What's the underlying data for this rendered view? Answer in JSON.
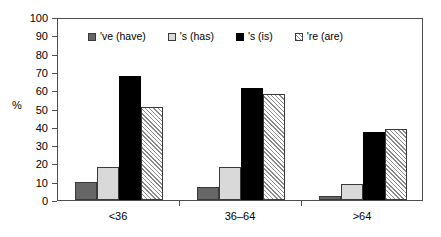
{
  "chart_data": {
    "type": "bar",
    "title": "",
    "xlabel": "",
    "ylabel": "%",
    "ylim": [
      0,
      100
    ],
    "ytick_step": 10,
    "yticks": [
      "100",
      "90",
      "80",
      "70",
      "60",
      "50",
      "40",
      "30",
      "20",
      "10",
      "0"
    ],
    "grid": false,
    "legend_position": "inside-top",
    "categories": [
      "<36",
      "36–64",
      ">64"
    ],
    "series": [
      {
        "name": "'ve (have)",
        "color": "#666666",
        "fill": "solid-dark-gray",
        "values": [
          10,
          7,
          2
        ]
      },
      {
        "name": "'s (has)",
        "color": "#d9d9d9",
        "fill": "solid-light-gray",
        "values": [
          18,
          18,
          9
        ]
      },
      {
        "name": "'s (is)",
        "color": "#000000",
        "fill": "solid-black",
        "values": [
          68,
          61,
          37
        ]
      },
      {
        "name": "'re (are)",
        "color": "#8a8a8a",
        "fill": "diagonal-hatch",
        "values": [
          51,
          58,
          39
        ]
      }
    ]
  }
}
